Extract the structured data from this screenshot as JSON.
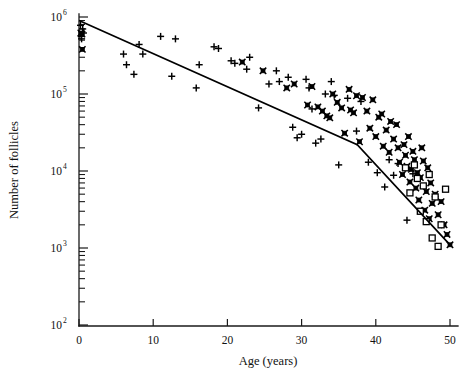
{
  "figure": {
    "width": 470,
    "height": 374,
    "background": "#ffffff",
    "ink_color": "#000000"
  },
  "chart_data": {
    "type": "scatter",
    "title": "",
    "subtitle": "",
    "xlabel": "Age (years)",
    "ylabel": "Number of follicles",
    "xscale": "linear",
    "yscale": "log",
    "xlim": [
      0,
      50
    ],
    "ylim": [
      100,
      1000000
    ],
    "grid": false,
    "legend_position": "none",
    "xticks": [
      0,
      10,
      20,
      30,
      40,
      50
    ],
    "xtick_labels": [
      "0",
      "10",
      "20",
      "30",
      "40",
      "50"
    ],
    "yticks": [
      100,
      1000,
      10000,
      100000,
      1000000
    ],
    "ytick_labels": [
      "10",
      "10",
      "10",
      "10",
      "10"
    ],
    "ytick_exponents": [
      "2",
      "3",
      "4",
      "5",
      "6"
    ],
    "y_minor_ticks": true,
    "annotations": [],
    "series": [
      {
        "name": "plus-marker-series",
        "marker": "plus",
        "points": [
          [
            0.2,
            780000
          ],
          [
            0.3,
            560000
          ],
          [
            0.35,
            520000
          ],
          [
            0.5,
            700000
          ],
          [
            0.6,
            620000
          ],
          [
            6.0,
            330000
          ],
          [
            6.4,
            240000
          ],
          [
            7.4,
            180000
          ],
          [
            8.1,
            440000
          ],
          [
            8.6,
            330000
          ],
          [
            11.0,
            560000
          ],
          [
            12.5,
            170000
          ],
          [
            13.0,
            520000
          ],
          [
            15.8,
            120000
          ],
          [
            16.2,
            240000
          ],
          [
            18.2,
            410000
          ],
          [
            18.8,
            390000
          ],
          [
            20.5,
            270000
          ],
          [
            21.0,
            250000
          ],
          [
            22.6,
            210000
          ],
          [
            23.0,
            300000
          ],
          [
            24.2,
            66000
          ],
          [
            25.6,
            135000
          ],
          [
            26.6,
            200000
          ],
          [
            27.0,
            145000
          ],
          [
            28.2,
            165000
          ],
          [
            28.8,
            37000
          ],
          [
            29.4,
            27000
          ],
          [
            30.0,
            30000
          ],
          [
            30.6,
            155000
          ],
          [
            31.0,
            120000
          ],
          [
            31.4,
            64000
          ],
          [
            31.9,
            23000
          ],
          [
            32.6,
            26000
          ],
          [
            33.2,
            100000
          ],
          [
            34.0,
            145000
          ],
          [
            34.4,
            96000
          ],
          [
            35.0,
            12000
          ],
          [
            36.2,
            88000
          ],
          [
            37.4,
            33000
          ],
          [
            38.0,
            80000
          ],
          [
            39.0,
            13000
          ],
          [
            40.2,
            9500
          ],
          [
            41.2,
            6200
          ],
          [
            41.8,
            14000
          ],
          [
            42.4,
            8800
          ],
          [
            43.0,
            12500
          ],
          [
            44.2,
            2300
          ],
          [
            45.0,
            9200
          ]
        ]
      },
      {
        "name": "filled-star-marker-series",
        "marker": "star",
        "points": [
          [
            0.25,
            620000
          ],
          [
            0.4,
            600000
          ],
          [
            0.45,
            380000
          ],
          [
            22.0,
            260000
          ],
          [
            24.8,
            200000
          ],
          [
            28.0,
            120000
          ],
          [
            29.0,
            135000
          ],
          [
            30.8,
            72000
          ],
          [
            31.4,
            125000
          ],
          [
            32.2,
            68000
          ],
          [
            32.8,
            60000
          ],
          [
            33.4,
            52000
          ],
          [
            33.8,
            49000
          ],
          [
            34.2,
            100000
          ],
          [
            34.8,
            78000
          ],
          [
            35.4,
            66000
          ],
          [
            35.8,
            31000
          ],
          [
            36.4,
            115000
          ],
          [
            36.6,
            62000
          ],
          [
            37.0,
            57000
          ],
          [
            37.4,
            95000
          ],
          [
            37.8,
            24000
          ],
          [
            38.2,
            90000
          ],
          [
            38.8,
            60000
          ],
          [
            39.2,
            36000
          ],
          [
            39.6,
            84000
          ],
          [
            40.0,
            28000
          ],
          [
            40.4,
            50000
          ],
          [
            40.8,
            55000
          ],
          [
            41.0,
            21000
          ],
          [
            41.4,
            34000
          ],
          [
            41.8,
            17500
          ],
          [
            42.0,
            44000
          ],
          [
            42.4,
            26000
          ],
          [
            42.8,
            40000
          ],
          [
            43.0,
            20000
          ],
          [
            43.2,
            13000
          ],
          [
            43.6,
            9000
          ],
          [
            43.8,
            22000
          ],
          [
            44.0,
            16000
          ],
          [
            44.2,
            11500
          ],
          [
            44.4,
            28000
          ],
          [
            44.6,
            7200
          ],
          [
            44.8,
            10500
          ],
          [
            45.0,
            18000
          ],
          [
            45.2,
            14000
          ],
          [
            45.4,
            6000
          ],
          [
            45.6,
            9500
          ],
          [
            45.8,
            4200
          ],
          [
            46.0,
            8200
          ],
          [
            46.2,
            20000
          ],
          [
            46.4,
            13500
          ],
          [
            46.6,
            3100
          ],
          [
            46.8,
            5400
          ],
          [
            47.0,
            11000
          ],
          [
            47.2,
            2400
          ],
          [
            47.4,
            7000
          ],
          [
            47.6,
            3800
          ],
          [
            48.0,
            5000
          ],
          [
            48.4,
            2700
          ],
          [
            48.8,
            4000
          ],
          [
            49.2,
            2000
          ],
          [
            49.6,
            1500
          ],
          [
            50.0,
            1100
          ]
        ]
      },
      {
        "name": "open-square-marker-series",
        "marker": "square",
        "points": [
          [
            44.0,
            11000
          ],
          [
            44.6,
            5200
          ],
          [
            45.2,
            12000
          ],
          [
            45.6,
            8000
          ],
          [
            46.0,
            3000
          ],
          [
            46.4,
            6400
          ],
          [
            46.8,
            2200
          ],
          [
            47.2,
            9000
          ],
          [
            47.6,
            1350
          ],
          [
            48.0,
            4600
          ],
          [
            48.4,
            1050
          ],
          [
            48.8,
            2000
          ],
          [
            49.4,
            5800
          ]
        ]
      }
    ],
    "fit_line": {
      "name": "biphasic-regression-line",
      "style": "solid",
      "color": "#000000",
      "breakpoint_age": 37.5,
      "vertices": [
        [
          0,
          900000
        ],
        [
          37.5,
          22000
        ],
        [
          50.0,
          1100
        ]
      ]
    }
  }
}
